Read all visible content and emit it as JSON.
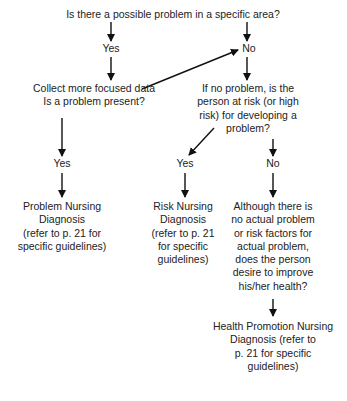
{
  "diagram": {
    "type": "flowchart",
    "nodes": {
      "q_possible_problem": "Is there a possible problem in a specific area?",
      "yes_1": "Yes",
      "no_1": "No",
      "collect_data": [
        "Collect more focused data",
        "Is a problem present?"
      ],
      "risk_question": [
        "If no problem, is the",
        "person at risk (or high",
        "risk) for developing a",
        "problem?"
      ],
      "yes_problem": "Yes",
      "yes_risk": "Yes",
      "no_risk": "No",
      "problem_dx": [
        "Problem Nursing",
        "Diagnosis",
        "(refer to p. 21 for",
        "specific guidelines)"
      ],
      "risk_dx": [
        "Risk Nursing",
        "Diagnosis",
        "(refer to p. 21",
        "for specific",
        "guidelines)"
      ],
      "improve_question": [
        "Although there is",
        "no actual problem",
        "or risk factors for",
        "actual problem,",
        "does the person",
        "desire to improve",
        "his/her health?"
      ],
      "health_promotion_dx": [
        "Health Promotion Nursing",
        "Diagnosis (refer to",
        "p. 21 for specific",
        "guidelines)"
      ]
    },
    "edges": [
      [
        "q_possible_problem",
        "yes_1"
      ],
      [
        "q_possible_problem",
        "no_1"
      ],
      [
        "yes_1",
        "collect_data"
      ],
      [
        "collect_data",
        "no_1"
      ],
      [
        "no_1",
        "risk_question"
      ],
      [
        "collect_data",
        "yes_problem"
      ],
      [
        "yes_problem",
        "problem_dx"
      ],
      [
        "risk_question",
        "yes_risk"
      ],
      [
        "risk_question",
        "no_risk"
      ],
      [
        "yes_risk",
        "risk_dx"
      ],
      [
        "no_risk",
        "improve_question"
      ],
      [
        "improve_question",
        "health_promotion_dx"
      ]
    ]
  }
}
